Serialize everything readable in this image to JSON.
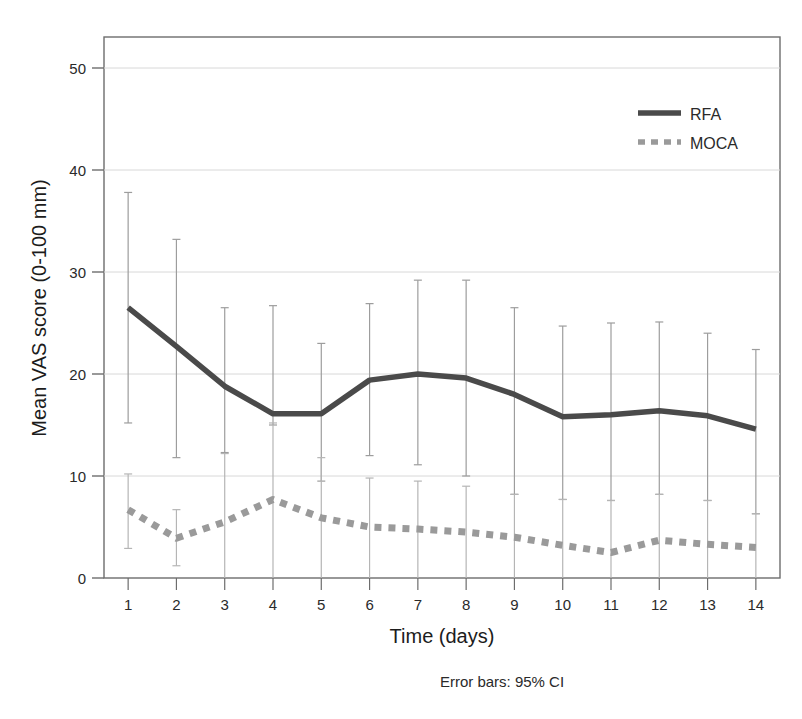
{
  "chart_data": {
    "type": "line",
    "title": "",
    "xlabel": "Time (days)",
    "ylabel": "Mean VAS score (0-100 mm)",
    "x": [
      1,
      2,
      3,
      4,
      5,
      6,
      7,
      8,
      9,
      10,
      11,
      12,
      13,
      14
    ],
    "categories": [
      "1",
      "2",
      "3",
      "4",
      "5",
      "6",
      "7",
      "8",
      "9",
      "10",
      "11",
      "12",
      "13",
      "14"
    ],
    "xlim": [
      0.5,
      14.5
    ],
    "ylim": [
      0,
      52
    ],
    "yticks": [
      0,
      10,
      20,
      30,
      40,
      50
    ],
    "ytick_labels": [
      "0",
      "10",
      "20",
      "30",
      "40",
      "50"
    ],
    "grid": "horizontal",
    "legend_position": "top-right",
    "footnote": "Error bars: 95% CI",
    "series": [
      {
        "name": "RFA",
        "style": "solid",
        "color": "#4a4a4a",
        "values": [
          26.5,
          22.7,
          18.8,
          16.1,
          16.1,
          19.4,
          20.0,
          19.6,
          18.0,
          15.8,
          16.0,
          16.4,
          15.9,
          14.6
        ],
        "ci_lower": [
          15.2,
          11.8,
          12.3,
          15.0,
          9.5,
          12.0,
          11.1,
          10.0,
          8.2,
          7.7,
          7.6,
          8.2,
          7.6,
          6.3
        ],
        "ci_upper": [
          37.8,
          33.2,
          26.5,
          26.7,
          23.0,
          26.9,
          29.2,
          29.2,
          26.5,
          24.7,
          25.0,
          25.1,
          24.0,
          22.4
        ]
      },
      {
        "name": "MOCA",
        "style": "dotted",
        "color": "#9a9a9a",
        "values": [
          6.7,
          3.9,
          5.5,
          7.7,
          5.9,
          5.0,
          4.8,
          4.5,
          4.0,
          3.2,
          2.5,
          3.7,
          3.3,
          3.0
        ],
        "ci_lower": [
          2.9,
          1.2,
          0.0,
          0.0,
          0.0,
          0.0,
          0.0,
          0.0,
          0.0,
          0.0,
          0.0,
          0.0,
          0.0,
          0.0
        ],
        "ci_upper": [
          10.2,
          6.7,
          12.2,
          15.2,
          11.8,
          9.8,
          9.5,
          9.0,
          8.2,
          7.7,
          7.6,
          8.2,
          7.6,
          6.3
        ]
      }
    ]
  },
  "legend": {
    "items": [
      {
        "label": "RFA"
      },
      {
        "label": "MOCA"
      }
    ]
  },
  "axes": {
    "x_title": "Time (days)",
    "y_title": "Mean VAS score (0-100 mm)"
  },
  "footnote": {
    "text": "Error bars: 95% CI"
  }
}
